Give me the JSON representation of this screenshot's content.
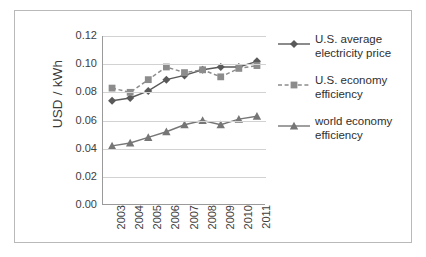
{
  "chart_data": {
    "type": "line",
    "title": "",
    "xlabel": "",
    "ylabel": "USD / kWh",
    "categories": [
      "2003",
      "2004",
      "2005",
      "2006",
      "2007",
      "2008",
      "2009",
      "2010",
      "2011"
    ],
    "ylim": [
      0.0,
      0.12
    ],
    "yticks": [
      "0.12",
      "0.10",
      "0.08",
      "0.06",
      "0.04",
      "0.02",
      "0.00"
    ],
    "ytick_values": [
      0.12,
      0.1,
      0.08,
      0.06,
      0.04,
      0.02,
      0.0
    ],
    "grid": true,
    "legend_position": "right",
    "series": [
      {
        "name": "U.S. average electricity price",
        "marker": "diamond",
        "line_style": "solid",
        "color": "#595959",
        "values": [
          0.074,
          0.076,
          0.081,
          0.089,
          0.092,
          0.096,
          0.098,
          0.098,
          0.102
        ]
      },
      {
        "name": "U.S. economy efficiency",
        "marker": "square",
        "line_style": "dashed",
        "color": "#8c8c8c",
        "values": [
          0.083,
          0.08,
          0.089,
          0.098,
          0.094,
          0.096,
          0.091,
          0.097,
          0.099
        ]
      },
      {
        "name": "world economy efficiency",
        "marker": "triangle",
        "line_style": "solid",
        "color": "#767676",
        "values": [
          0.042,
          0.044,
          0.048,
          0.052,
          0.057,
          0.06,
          0.057,
          0.061,
          0.063
        ]
      }
    ]
  },
  "legend": {
    "items": [
      {
        "label_line1": "U.S. average",
        "label_line2": "electricity price"
      },
      {
        "label_line1": "U.S. economy",
        "label_line2": "efficiency"
      },
      {
        "label_line1": "world economy",
        "label_line2": "efficiency"
      }
    ]
  },
  "colors": {
    "series1": "#595959",
    "series2": "#8c8c8c",
    "series3": "#767676",
    "grid": "#d2d2d2",
    "axis": "#9a9a9a",
    "frame": "#b9b9b9",
    "text": "#3b3b3b"
  }
}
